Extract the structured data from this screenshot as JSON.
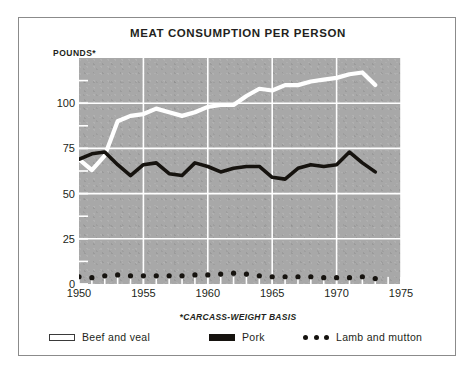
{
  "figure": {
    "title": "MEAT CONSUMPTION PER PERSON",
    "ylabel": "POUNDS*",
    "footnote": "*CARCASS-WEIGHT BASIS",
    "background_color": "#a8a8a8",
    "border_color": "#8b8b8b"
  },
  "legend": [
    {
      "label": "Beef and veal",
      "marker": "open-line-swatch",
      "color": "#ffffff"
    },
    {
      "label": "Pork",
      "marker": "solid-line-swatch",
      "color": "#16130f"
    },
    {
      "label": "Lamb and mutton",
      "marker": "dotted-swatch",
      "color": "#16130f"
    }
  ],
  "chart_data": {
    "type": "line",
    "title": "MEAT CONSUMPTION PER PERSON",
    "xlabel": "",
    "ylabel": "POUNDS*",
    "note": "*CARCASS-WEIGHT BASIS",
    "xlim": [
      1950,
      1975
    ],
    "ylim": [
      0,
      125
    ],
    "xticks": [
      1950,
      1955,
      1960,
      1965,
      1970,
      1975
    ],
    "yticks": [
      0,
      25,
      50,
      75,
      100
    ],
    "yticks_minor": [
      12.5,
      37.5,
      62.5,
      87.5,
      112.5
    ],
    "grid": true,
    "legend_position": "below",
    "x": [
      1950,
      1951,
      1952,
      1953,
      1954,
      1955,
      1956,
      1957,
      1958,
      1959,
      1960,
      1961,
      1962,
      1963,
      1964,
      1965,
      1966,
      1967,
      1968,
      1969,
      1970,
      1971,
      1972,
      1973
    ],
    "series": [
      {
        "name": "Beef and veal",
        "color": "#ffffff",
        "style": "line",
        "values": [
          69,
          63,
          71,
          90,
          93,
          94,
          97,
          95,
          93,
          95,
          98,
          99,
          99,
          104,
          108,
          107,
          110,
          110,
          112,
          113,
          114,
          116,
          117,
          110
        ]
      },
      {
        "name": "Pork",
        "color": "#16130f",
        "style": "line",
        "values": [
          69,
          72,
          73,
          66,
          60,
          66,
          67,
          61,
          60,
          67,
          65,
          62,
          64,
          65,
          65,
          59,
          58,
          64,
          66,
          65,
          66,
          73,
          67,
          62
        ]
      },
      {
        "name": "Lamb and mutton",
        "color": "#16130f",
        "style": "dots",
        "values": [
          4,
          3.5,
          4.5,
          5,
          4.5,
          4.5,
          4.5,
          4.5,
          4.5,
          5,
          5,
          5.5,
          6,
          5.5,
          4.5,
          4,
          4,
          4,
          4,
          3.5,
          3.5,
          3.5,
          4,
          3
        ]
      }
    ]
  }
}
